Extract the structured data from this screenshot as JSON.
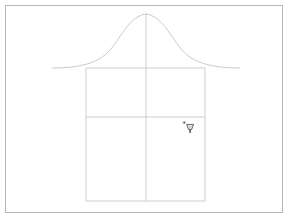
{
  "window": {
    "title": "Untitled Drawing",
    "background_color": "#ffffff"
  },
  "canvas": {
    "name": "drawing-canvas",
    "frame_border_color": "#b6b6b6",
    "background_color": "#ffffff",
    "width": 278,
    "height": 208,
    "stroke_color": "#c2c2c2",
    "stroke_width": "0.8"
  },
  "shapes": {
    "bell_curve": {
      "label": "bell-curve",
      "stroke_color": "#bdbdbd",
      "apex_x": 140,
      "apex_y": 8,
      "baseline_y": 62,
      "left_x": 46,
      "right_x": 234,
      "path": "M 46 62 C 72 62, 92 58, 104 44 C 116 30, 124 10, 140 8 C 156 10, 164 30, 176 44 C 188 58, 208 62, 234 62"
    },
    "body_rect": {
      "label": "body-rectangle",
      "stroke_color": "#c2c2c2",
      "x": 80,
      "y": 62,
      "width": 119,
      "height": 133
    },
    "horizontal_divider": {
      "label": "horizontal-divider",
      "stroke_color": "#c2c2c2",
      "x1": 80,
      "y1": 111,
      "x2": 199,
      "y2": 111
    },
    "vertical_center_line": {
      "label": "vertical-center-line",
      "stroke_color": "#c2c2c2",
      "x1": 140,
      "y1": 8,
      "x2": 140,
      "y2": 195
    }
  },
  "cursor": {
    "icon": "precision-pick-cursor",
    "color": "#6e6e6e",
    "x": 183,
    "y": 123,
    "visible": true
  }
}
